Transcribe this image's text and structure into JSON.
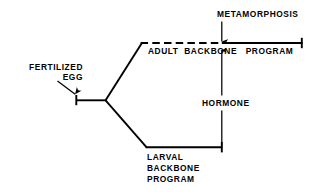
{
  "figure": {
    "kind": "developmental-pathway-diagram",
    "background_color": "#ffffff",
    "stroke_color": "#000000",
    "labels": {
      "fertilized_egg_line1": "FERTILIZED",
      "fertilized_egg_line2": "EGG",
      "metamorphosis": "METAMORPHOSIS",
      "adult_backbone_program": "ADULT  BACKBONE   PROGRAM",
      "hormone": "HORMONE",
      "larval_line1": "LARVAL",
      "larval_line2": "BACKBONE",
      "larval_line3": "PROGRAM"
    },
    "elements": {
      "fertilized_egg_arrow": "arrow-pointing-down-right-to-start-tick",
      "start_tick": "vertical-tick-at-pathway-origin",
      "start_stub": "horizontal-segment-from-start-tick-to-fork",
      "fork": "branch-point-splitting-adult-and-larval-paths",
      "adult_diagonal": "diagonal-rising-to-adult-program-line",
      "larval_diagonal": "diagonal-falling-to-larval-program-line",
      "adult_program_line_dashed": "dashed-portion-before-metamorphosis",
      "adult_program_line_solid": "solid-portion-after-metamorphosis",
      "adult_program_end_tick": "vertical-end-tick-of-adult-line",
      "larval_program_line": "horizontal-larval-program-line",
      "larval_program_end_tick": "vertical-end-tick-of-larval-line",
      "metamorphosis_arrow": "arrow-pointing-down-to-adult-line",
      "hormone_arrow": "arrow-pointing-up-from-larval-line-to-adult-line"
    }
  }
}
